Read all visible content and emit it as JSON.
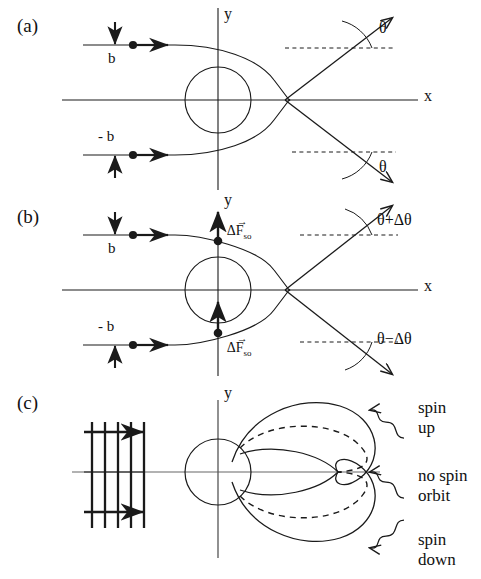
{
  "figure": {
    "panels": [
      {
        "tag": "(a)",
        "axis_x_label": "x",
        "axis_y_label": "y",
        "impact_param_top": "b",
        "impact_param_bottom": "- b",
        "angle_top": "θ",
        "angle_bottom": "θ"
      },
      {
        "tag": "(b)",
        "axis_x_label": "x",
        "axis_y_label": "y",
        "impact_param_top": "b",
        "impact_param_bottom": "- b",
        "force_top": "ΔF",
        "force_top_sub": "so",
        "force_bottom": "ΔF",
        "force_bottom_sub": "so",
        "angle_top": "θ+Δθ",
        "angle_bottom": "θ−Δθ"
      },
      {
        "tag": "(c)",
        "axis_y_label": "y",
        "annotation_spin_up": "spin\nup",
        "annotation_no_spin_orbit": "no spin\norbit",
        "annotation_spin_down": "spin\ndown"
      }
    ],
    "colors": {
      "stroke": "#1a1a1a",
      "background": "#ffffff"
    }
  }
}
